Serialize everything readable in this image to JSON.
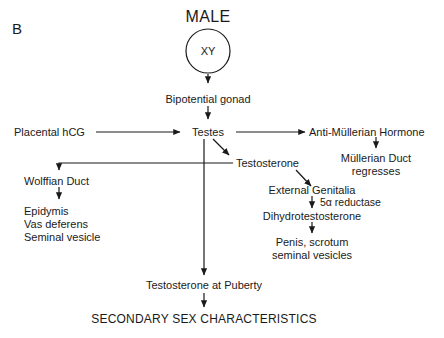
{
  "figure": {
    "panel_label": "B",
    "title": "MALE",
    "background_color": "#ffffff",
    "line_color": "#1a1a1a"
  },
  "nodes": {
    "karyotype": "XY",
    "bipotential_gonad": "Bipotential gonad",
    "placental_hcg": "Placental hCG",
    "testes": "Testes",
    "anti_mullerian_hormone": "Anti-Müllerian Hormone",
    "mullerian_duct_regresses": "Müllerian Duct\nregresses",
    "testosterone": "Testosterone",
    "wolffian_duct": "Wolffian Duct",
    "wolffian_derivatives": "Epidymis\nVas deferens\nSeminal vesicle",
    "external_genitalia": "External Genitalia",
    "five_alpha_reductase": "5α reductase",
    "dihydrotestosterone": "Dihydrotestosterone",
    "dht_targets": "Penis, scrotum\nseminal vesicles",
    "testosterone_at_puberty": "Testosterone at Puberty",
    "secondary_sex_characteristics": "SECONDARY SEX CHARACTERISTICS"
  }
}
